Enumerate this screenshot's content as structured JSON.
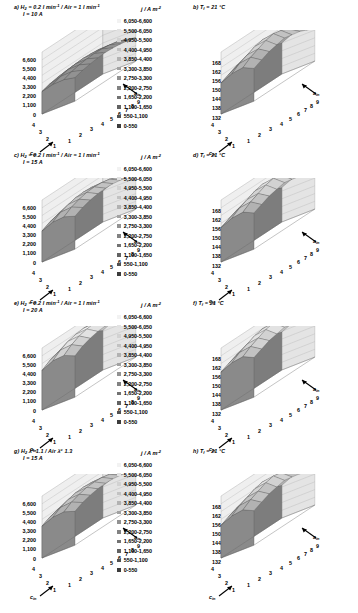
{
  "figure": {
    "panel_count": 8,
    "current_legend_title": "j / A m",
    "current_legend_exp": "-2",
    "temp_legend_title": "T",
    "temp_legend_sub": "s",
    "temp_legend_unit": "/ °C"
  },
  "legends": {
    "current": [
      {
        "label": "6,050-6,600",
        "color": "#f2f2f2"
      },
      {
        "label": "5,500-6,050",
        "color": "#e2e2e2"
      },
      {
        "label": "4,950-5,500",
        "color": "#d2d2d2"
      },
      {
        "label": "4,400-4,950",
        "color": "#c2c2c2"
      },
      {
        "label": "3,850-4,400",
        "color": "#b2b2b2"
      },
      {
        "label": "3,300-3,850",
        "color": "#a2a2a2"
      },
      {
        "label": "2,750-3,300",
        "color": "#929292"
      },
      {
        "label": "2,200-2,750",
        "color": "#828282"
      },
      {
        "label": "1,650-2,200",
        "color": "#727272"
      },
      {
        "label": "1,100-1,650",
        "color": "#626262"
      },
      {
        "label": "550-1,100",
        "color": "#525252"
      },
      {
        "label": "0-550",
        "color": "#3c3c3c"
      }
    ],
    "temperature": [
      {
        "label": "165-168",
        "color": "#f2f2f2"
      },
      {
        "label": "162-165",
        "color": "#e2e2e2"
      },
      {
        "label": "159-162",
        "color": "#d2d2d2"
      },
      {
        "label": "156-159",
        "color": "#c2c2c2"
      },
      {
        "label": "153-156",
        "color": "#b2b2b2"
      },
      {
        "label": "150-153",
        "color": "#a2a2a2"
      },
      {
        "label": "147-150",
        "color": "#929292"
      },
      {
        "label": "144-147",
        "color": "#828282"
      },
      {
        "label": "141-144",
        "color": "#727272"
      },
      {
        "label": "138-141",
        "color": "#626262"
      },
      {
        "label": "135-138",
        "color": "#525252"
      },
      {
        "label": "132-135",
        "color": "#3c3c3c"
      }
    ]
  },
  "axes": {
    "current_zticks": [
      "6,600",
      "5,500",
      "4,400",
      "3,300",
      "2,200",
      "1,100",
      "0"
    ],
    "temp_zticks": [
      "168",
      "162",
      "156",
      "150",
      "144",
      "138",
      "132"
    ],
    "xticks": [
      "4",
      "3",
      "2",
      "1"
    ],
    "yticks": [
      "1",
      "2",
      "3",
      "4",
      "5",
      "6",
      "7",
      "8",
      "9"
    ],
    "xlabel": "c",
    "xlabel_sub": "in",
    "ylabel": "a",
    "ylabel_sub": "in"
  },
  "panels": [
    {
      "id": "a",
      "tag": "a)",
      "line1_pre": "H",
      "line1_sub": "2",
      "line1_mid": " = 0.2 l min",
      "line1_exp": "-1",
      "line1_post": " / Air = 1 l min",
      "line1_exp2": "-1",
      "line2": "I = 10 A",
      "quantity": "current",
      "side": "left"
    },
    {
      "id": "b",
      "tag": "b)",
      "line1_pre": "T",
      "line1_sub": "f",
      "line1_mid": " = 21 °C",
      "line1_exp": "",
      "line1_post": "",
      "line1_exp2": "",
      "line2": "",
      "quantity": "temperature",
      "side": "right"
    },
    {
      "id": "c",
      "tag": "c)",
      "line1_pre": "H",
      "line1_sub": "2",
      "line1_mid": " = 0.2 l min",
      "line1_exp": "-1",
      "line1_post": " / Air = 1 l min",
      "line1_exp2": "-1",
      "line2": "I = 15 A",
      "quantity": "current",
      "side": "left"
    },
    {
      "id": "d",
      "tag": "d)",
      "line1_pre": "T",
      "line1_sub": "f",
      "line1_mid": " = 21 °C",
      "line1_exp": "",
      "line1_post": "",
      "line1_exp2": "",
      "line2": "",
      "quantity": "temperature",
      "side": "right"
    },
    {
      "id": "e",
      "tag": "e)",
      "line1_pre": "H",
      "line1_sub": "2",
      "line1_mid": " = 0.2 l min",
      "line1_exp": "-1",
      "line1_post": " / Air = 1 l min",
      "line1_exp2": "-1",
      "line2": "I = 20 A",
      "quantity": "current",
      "side": "left"
    },
    {
      "id": "f",
      "tag": "f)",
      "line1_pre": "T",
      "line1_sub": "f",
      "line1_mid": " = 21 °C",
      "line1_exp": "",
      "line1_post": "",
      "line1_exp2": "",
      "line2": "",
      "quantity": "temperature",
      "side": "right"
    },
    {
      "id": "g",
      "tag": "g)",
      "line1_pre": "H",
      "line1_sub": "2",
      "line1_mid": " λ",
      "line1_exp": "a",
      "line1_post": " 1.1 / Air λ",
      "line1_exp2": "c",
      "line1_tail": " 1.3",
      "line2": "I = 15 A",
      "quantity": "current",
      "side": "left"
    },
    {
      "id": "h",
      "tag": "h)",
      "line1_pre": "T",
      "line1_sub": "f",
      "line1_mid": " = 21 °C",
      "line1_exp": "",
      "line1_post": "",
      "line1_exp2": "",
      "line2": "",
      "quantity": "temperature",
      "side": "right"
    }
  ],
  "chart_data": {
    "type": "surface",
    "x": [
      1,
      2,
      3,
      4
    ],
    "y": [
      1,
      2,
      3,
      4,
      5,
      6,
      7,
      8,
      9
    ],
    "xlabel": "c_in",
    "ylabel": "a_in",
    "surfaces": [
      {
        "panel": "a",
        "zlabel": "j / A m^-2",
        "zlim": [
          0,
          6600
        ],
        "zticks": [
          0,
          1100,
          2200,
          3300,
          4400,
          5500,
          6600
        ],
        "z": [
          [
            2400,
            2650,
            2800,
            2900,
            2950,
            2900,
            2800,
            2650,
            2400
          ],
          [
            2700,
            3000,
            3200,
            3300,
            3350,
            3300,
            3200,
            3000,
            2700
          ],
          [
            2750,
            3050,
            3250,
            3350,
            3400,
            3350,
            3250,
            3050,
            2750
          ],
          [
            2500,
            2750,
            2900,
            3000,
            3050,
            3000,
            2900,
            2750,
            2500
          ]
        ]
      },
      {
        "panel": "b",
        "zlabel": "T_s / °C",
        "zlim": [
          132,
          168
        ],
        "zticks": [
          132,
          138,
          144,
          150,
          156,
          162,
          168
        ],
        "z": [
          [
            150,
            152,
            154,
            155,
            156,
            155,
            154,
            152,
            150
          ],
          [
            153,
            156,
            158,
            160,
            161,
            160,
            158,
            156,
            153
          ],
          [
            154,
            157,
            159,
            161,
            162,
            161,
            159,
            157,
            154
          ],
          [
            151,
            153,
            155,
            156,
            157,
            156,
            155,
            153,
            151
          ]
        ]
      },
      {
        "panel": "c",
        "zlabel": "j / A m^-2",
        "zlim": [
          0,
          6600
        ],
        "zticks": [
          0,
          1100,
          2200,
          3300,
          4400,
          5500,
          6600
        ],
        "z": [
          [
            3300,
            3700,
            3950,
            4100,
            4150,
            4100,
            3950,
            3700,
            3300
          ],
          [
            3800,
            4300,
            4600,
            4800,
            4850,
            4800,
            4600,
            4300,
            3800
          ],
          [
            3900,
            4400,
            4700,
            4900,
            4950,
            4900,
            4700,
            4400,
            3900
          ],
          [
            3500,
            3900,
            4150,
            4300,
            4350,
            4300,
            4150,
            3900,
            3500
          ]
        ]
      },
      {
        "panel": "d",
        "zlabel": "T_s / °C",
        "zlim": [
          132,
          168
        ],
        "zticks": [
          132,
          138,
          144,
          150,
          156,
          162,
          168
        ],
        "z": [
          [
            152,
            154,
            156,
            157,
            158,
            157,
            156,
            154,
            152
          ],
          [
            155,
            158,
            160,
            162,
            163,
            162,
            160,
            158,
            155
          ],
          [
            156,
            159,
            161,
            163,
            164,
            163,
            161,
            159,
            156
          ],
          [
            153,
            155,
            157,
            158,
            159,
            158,
            157,
            155,
            153
          ]
        ]
      },
      {
        "panel": "e",
        "zlabel": "j / A m^-2",
        "zlim": [
          0,
          6600
        ],
        "zticks": [
          0,
          1100,
          2200,
          3300,
          4400,
          5500,
          6600
        ],
        "z": [
          [
            4200,
            4700,
            5000,
            5200,
            5250,
            5200,
            5000,
            4700,
            4200
          ],
          [
            4800,
            5400,
            5800,
            6000,
            6100,
            6000,
            5800,
            5400,
            4800
          ],
          [
            4900,
            5500,
            5900,
            6100,
            6200,
            6100,
            5900,
            5500,
            4900
          ],
          [
            4400,
            4900,
            5200,
            5400,
            5450,
            5400,
            5200,
            4900,
            4400
          ]
        ]
      },
      {
        "panel": "f",
        "zlabel": "T_s / °C",
        "zlim": [
          132,
          168
        ],
        "zticks": [
          132,
          138,
          144,
          150,
          156,
          162,
          168
        ],
        "z": [
          [
            154,
            156,
            158,
            159,
            160,
            159,
            158,
            156,
            154
          ],
          [
            157,
            160,
            162,
            164,
            165,
            164,
            162,
            160,
            157
          ],
          [
            158,
            161,
            163,
            165,
            166,
            165,
            163,
            161,
            158
          ],
          [
            155,
            157,
            159,
            160,
            161,
            160,
            159,
            157,
            155
          ]
        ]
      },
      {
        "panel": "g",
        "zlabel": "j / A m^-2",
        "zlim": [
          0,
          6600
        ],
        "zticks": [
          0,
          1100,
          2200,
          3300,
          4400,
          5500,
          6600
        ],
        "z": [
          [
            3400,
            3800,
            4050,
            4200,
            4250,
            4200,
            4050,
            3800,
            3400
          ],
          [
            3900,
            4400,
            4700,
            4900,
            4950,
            4900,
            4700,
            4400,
            3900
          ],
          [
            4000,
            4500,
            4800,
            5000,
            5050,
            5000,
            4800,
            4500,
            4000
          ],
          [
            3600,
            4000,
            4250,
            4400,
            4450,
            4400,
            4250,
            4000,
            3600
          ]
        ]
      },
      {
        "panel": "h",
        "zlabel": "T_s / °C",
        "zlim": [
          132,
          168
        ],
        "zticks": [
          132,
          138,
          144,
          150,
          156,
          162,
          168
        ],
        "z": [
          [
            151,
            153,
            155,
            156,
            157,
            156,
            155,
            153,
            151
          ],
          [
            154,
            157,
            159,
            161,
            162,
            161,
            159,
            157,
            154
          ],
          [
            155,
            158,
            160,
            162,
            163,
            162,
            160,
            158,
            155
          ],
          [
            152,
            154,
            156,
            157,
            158,
            157,
            156,
            154,
            152
          ]
        ]
      }
    ]
  }
}
